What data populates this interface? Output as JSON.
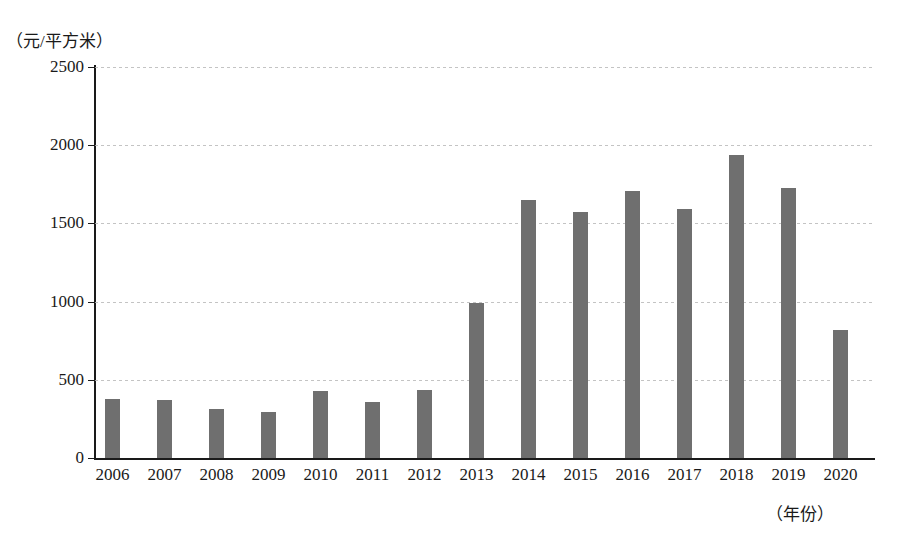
{
  "chart_data": {
    "type": "bar",
    "title": "",
    "subtitle": "",
    "ylabel": "（元/平方米）",
    "xlabel": "（年份）",
    "categories": [
      "2006",
      "2007",
      "2008",
      "2009",
      "2010",
      "2011",
      "2012",
      "2013",
      "2014",
      "2015",
      "2016",
      "2017",
      "2018",
      "2019",
      "2020"
    ],
    "values": [
      375,
      370,
      315,
      295,
      430,
      360,
      435,
      990,
      1650,
      1570,
      1705,
      1590,
      1935,
      1725,
      820
    ],
    "series": [
      {
        "name": "",
        "values": [
          375,
          370,
          315,
          295,
          430,
          360,
          435,
          990,
          1650,
          1570,
          1705,
          1590,
          1935,
          1725,
          820
        ]
      }
    ],
    "ylim": [
      0,
      2500
    ],
    "yticks": [
      0,
      500,
      1000,
      1500,
      2000,
      2500
    ],
    "ytick_labels": [
      "0",
      "500",
      "1000",
      "1500",
      "2000",
      "2500"
    ],
    "grid": true,
    "grid_axis": "y",
    "legend": false,
    "legend_position": "none",
    "bar_color": "#6f6f6f",
    "axis_color": "#1a1a1a",
    "grid_color": "#b9b9b9",
    "background": "#ffffff"
  }
}
